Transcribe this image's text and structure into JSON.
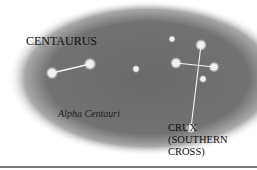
{
  "figure": {
    "labels": {
      "centaurus": "CENTAURUS",
      "alpha_centauri": "Alpha Centauri",
      "crux": "CRUX\n(SOUTHERN\nCROSS)"
    },
    "colors": {
      "sky": "#6e6e6e",
      "star": "#f2f2f2",
      "line": "#f5f5f5",
      "background": "#ffffff",
      "rule": "#777777"
    },
    "stars": [
      {
        "name": "centaurus-star-1",
        "x": 52,
        "y": 73,
        "r": 3.5
      },
      {
        "name": "centaurus-star-2",
        "x": 90,
        "y": 64,
        "r": 3.5
      },
      {
        "name": "center-star",
        "x": 136,
        "y": 69,
        "r": 2.2
      },
      {
        "name": "crux-top-star",
        "x": 201,
        "y": 45,
        "r": 3.3
      },
      {
        "name": "crux-left-star",
        "x": 176,
        "y": 63,
        "r": 3.3
      },
      {
        "name": "crux-right-star",
        "x": 214,
        "y": 67,
        "r": 3.0
      },
      {
        "name": "crux-bottom-star",
        "x": 191,
        "y": 128,
        "r": 3.0
      },
      {
        "name": "small-star-1",
        "x": 172,
        "y": 39,
        "r": 2.0
      },
      {
        "name": "small-star-2",
        "x": 203,
        "y": 79,
        "r": 2.2
      }
    ]
  }
}
